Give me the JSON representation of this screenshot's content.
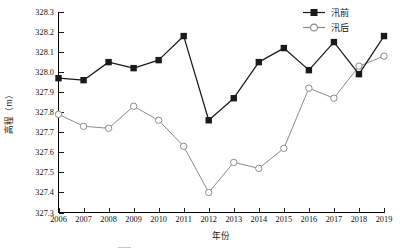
{
  "chart_data": {
    "type": "line",
    "title": "",
    "xlabel": "年份",
    "ylabel": "高程（m）",
    "x": [
      2006,
      2007,
      2008,
      2009,
      2010,
      2011,
      2012,
      2013,
      2014,
      2015,
      2016,
      2017,
      2018,
      2019
    ],
    "categories": [
      "2006",
      "2007",
      "2008",
      "2009",
      "2010",
      "2011",
      "2012",
      "2013",
      "2014",
      "2015",
      "2016",
      "2017",
      "2018",
      "2019"
    ],
    "series": [
      {
        "name": "汛前",
        "marker": "filled-square",
        "color": "#1a1a1a",
        "values": [
          327.97,
          327.96,
          328.05,
          328.02,
          328.06,
          328.18,
          327.76,
          327.87,
          328.05,
          328.12,
          328.01,
          328.15,
          327.99,
          328.18
        ]
      },
      {
        "name": "汛后",
        "marker": "open-circle",
        "color": "#8c8c8c",
        "values": [
          327.79,
          327.73,
          327.72,
          327.83,
          327.76,
          327.63,
          327.4,
          327.55,
          327.52,
          327.62,
          327.92,
          327.87,
          328.03,
          328.08
        ]
      }
    ],
    "ylim": [
      327.3,
      328.3
    ],
    "yticks": [
      "327.3",
      "327.4",
      "327.5",
      "327.6",
      "327.7",
      "327.8",
      "327.9",
      "328.0",
      "328.1",
      "328.2",
      "328.3"
    ],
    "ytick_values": [
      327.3,
      327.4,
      327.5,
      327.6,
      327.7,
      327.8,
      327.9,
      328.0,
      328.1,
      328.2,
      328.3
    ],
    "xlim": [
      2006,
      2019
    ],
    "grid": false,
    "legend_position": "top-right",
    "legend": [
      "汛前",
      "汛后"
    ]
  }
}
